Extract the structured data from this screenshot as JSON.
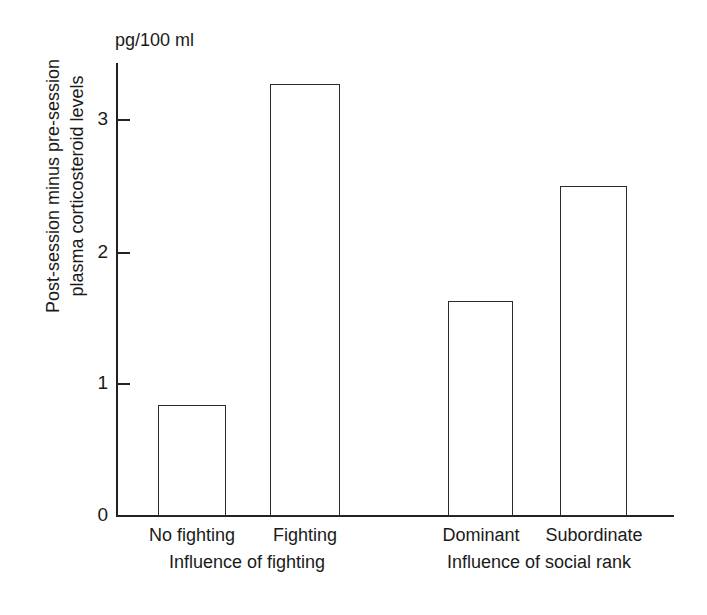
{
  "chart_data": {
    "type": "bar",
    "title": "",
    "subtitle": "",
    "unit_label": "pg/100 ml",
    "ylabel_line1": "Post-session minus pre-session",
    "ylabel_line2": "plasma corticosteroid levels",
    "xlabel": "",
    "categories": [
      "No fighting",
      "Fighting",
      "Dominant",
      "Subordinate"
    ],
    "values": [
      0.84,
      3.27,
      1.63,
      2.5
    ],
    "groups": [
      {
        "label": "Influence of fighting",
        "categories": [
          "No fighting",
          "Fighting"
        ]
      },
      {
        "label": "Influence of social rank",
        "categories": [
          "Dominant",
          "Subordinate"
        ]
      }
    ],
    "ylim": [
      0,
      3.43
    ],
    "yticks": [
      0,
      1,
      2,
      3
    ],
    "ytick_labels": [
      "0",
      "1",
      "2",
      "3"
    ],
    "grid": false,
    "legend": "none",
    "bar_fill": "#ffffff",
    "bar_edge": "#2b2b2b",
    "axis_color": "#222222",
    "background": "#ffffff"
  },
  "bars": [
    {
      "name": "no-fighting",
      "label": "No fighting",
      "value": 0.84,
      "x": 158,
      "width": 68,
      "top": 405,
      "height": 111
    },
    {
      "name": "fighting",
      "label": "Fighting",
      "value": 3.27,
      "x": 270,
      "width": 70,
      "top": 84,
      "height": 432
    },
    {
      "name": "dominant",
      "label": "Dominant",
      "value": 1.63,
      "x": 448,
      "width": 65,
      "top": 301,
      "height": 215
    },
    {
      "name": "subordinate",
      "label": "Subordinate",
      "value": 2.5,
      "x": 560,
      "width": 67,
      "top": 186,
      "height": 330
    }
  ],
  "yticks": [
    {
      "label": "3",
      "top": 120
    },
    {
      "label": "2",
      "top": 253
    },
    {
      "label": "1",
      "top": 384
    },
    {
      "label": "0",
      "top": 516
    }
  ],
  "category_labels": [
    {
      "label": "No fighting",
      "left": 130,
      "width": 124
    },
    {
      "label": "Fighting",
      "left": 248,
      "width": 114
    },
    {
      "label": "Dominant",
      "left": 421,
      "width": 120
    },
    {
      "label": "Subordinate",
      "left": 533,
      "width": 122
    }
  ],
  "group_labels": [
    {
      "label": "Influence of fighting",
      "left": 136,
      "width": 222
    },
    {
      "label": "Influence of social rank",
      "left": 425,
      "width": 228
    }
  ]
}
